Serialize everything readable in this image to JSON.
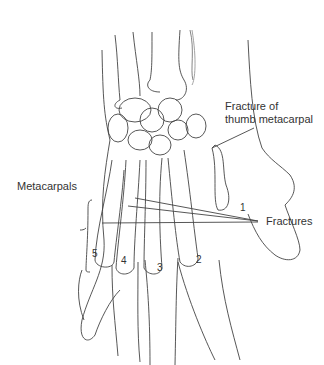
{
  "diagram": {
    "labels": {
      "thumb_fracture_line1": "Fracture of",
      "thumb_fracture_line2": "thumb metacarpal",
      "metacarpals": "Metacarpals",
      "fractures": "Fractures"
    },
    "metacarpal_numbers": [
      "1",
      "2",
      "3",
      "4",
      "5"
    ],
    "colors": {
      "line": "#444444",
      "text": "#333333",
      "background": "#ffffff"
    }
  }
}
